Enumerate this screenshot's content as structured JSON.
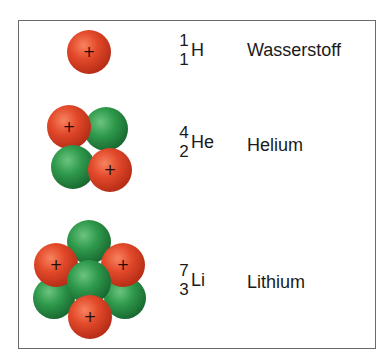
{
  "diagram": {
    "legend": {
      "proton": {
        "color": "#e04a2a",
        "sign": "+",
        "label": "Proton"
      },
      "neutron": {
        "color": "#2e9a4a",
        "label": "Neutron"
      }
    },
    "elements": [
      {
        "symbol": "H",
        "mass_number": "1",
        "atomic_number": "1",
        "name": "Wasserstoff",
        "particles": [
          {
            "type": "proton",
            "cx": 89,
            "cy": 52,
            "r": 22
          }
        ]
      },
      {
        "symbol": "He",
        "mass_number": "4",
        "atomic_number": "2",
        "name": "Helium",
        "particles": [
          {
            "type": "neutron",
            "cx": 106,
            "cy": 129,
            "r": 22
          },
          {
            "type": "proton",
            "cx": 69,
            "cy": 127,
            "r": 22
          },
          {
            "type": "neutron",
            "cx": 73,
            "cy": 167,
            "r": 22
          },
          {
            "type": "proton",
            "cx": 110,
            "cy": 170,
            "r": 22
          }
        ]
      },
      {
        "symbol": "Li",
        "mass_number": "7",
        "atomic_number": "3",
        "name": "Lithium",
        "particles": [
          {
            "type": "neutron",
            "cx": 89,
            "cy": 242,
            "r": 22
          },
          {
            "type": "neutron",
            "cx": 54,
            "cy": 298,
            "r": 21
          },
          {
            "type": "neutron",
            "cx": 125,
            "cy": 298,
            "r": 21
          },
          {
            "type": "proton",
            "cx": 56,
            "cy": 265,
            "r": 22
          },
          {
            "type": "proton",
            "cx": 123,
            "cy": 265,
            "r": 22
          },
          {
            "type": "neutron",
            "cx": 89,
            "cy": 282,
            "r": 22
          },
          {
            "type": "proton",
            "cx": 90,
            "cy": 317,
            "r": 22
          }
        ]
      }
    ]
  }
}
